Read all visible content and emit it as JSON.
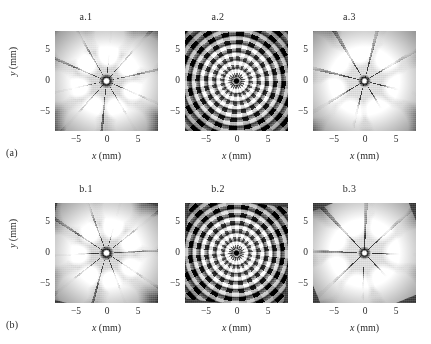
{
  "figure": {
    "rows": [
      {
        "row_label": "(a)",
        "panels": [
          {
            "title": "a.1",
            "xlabel_var": "x",
            "xlabel_unit": "(mm)",
            "ylabel_var": "y",
            "ylabel_unit": "(mm)",
            "xticks": [
              "−5",
              "0",
              "5"
            ],
            "yticks": [
              "5",
              "0",
              "−5"
            ]
          },
          {
            "title": "a.2",
            "xlabel_var": "x",
            "xlabel_unit": "(mm)",
            "ylabel_var": "y",
            "ylabel_unit": "(mm)",
            "xticks": [
              "−5",
              "0",
              "5"
            ],
            "yticks": [
              "5",
              "0",
              "−5"
            ]
          },
          {
            "title": "a.3",
            "xlabel_var": "x",
            "xlabel_unit": "(mm)",
            "ylabel_var": "y",
            "ylabel_unit": "(mm)",
            "xticks": [
              "−5",
              "0",
              "5"
            ],
            "yticks": [
              "5",
              "0",
              "−5"
            ]
          }
        ]
      },
      {
        "row_label": "(b)",
        "panels": [
          {
            "title": "b.1",
            "xlabel_var": "x",
            "xlabel_unit": "(mm)",
            "ylabel_var": "y",
            "ylabel_unit": "(mm)",
            "xticks": [
              "−5",
              "0",
              "5"
            ],
            "yticks": [
              "5",
              "0",
              "−5"
            ]
          },
          {
            "title": "b.2",
            "xlabel_var": "x",
            "xlabel_unit": "(mm)",
            "ylabel_var": "y",
            "ylabel_unit": "(mm)",
            "xticks": [
              "−5",
              "0",
              "5"
            ],
            "yticks": [
              "5",
              "0",
              "−5"
            ]
          },
          {
            "title": "b.3",
            "xlabel_var": "x",
            "xlabel_unit": "(mm)",
            "ylabel_var": "y",
            "ylabel_unit": "(mm)",
            "xticks": [
              "−5",
              "0",
              "5"
            ],
            "yticks": [
              "5",
              "0",
              "−5"
            ]
          }
        ]
      }
    ]
  },
  "chart_data": {
    "type": "heatmap",
    "title": "",
    "subtitle": "",
    "layout": {
      "rows": 2,
      "cols": 3,
      "grid_on": false,
      "legend": "none",
      "colormap": "gray",
      "background": "#ffffff"
    },
    "shared_axes": {
      "xlabel": "x (mm)",
      "ylabel": "y (mm)",
      "xlim": [
        -9,
        9
      ],
      "ylim": [
        -9,
        9
      ],
      "xticks": [
        -5,
        0,
        5
      ],
      "yticks": [
        -5,
        0,
        5
      ],
      "xticklabels": [
        "-5",
        "0",
        "5"
      ],
      "yticklabels": [
        "-5",
        "0",
        "5"
      ]
    },
    "panels": [
      {
        "id": "a.1",
        "row": "(a)",
        "col": 1,
        "description": "Grayscale transverse intensity pattern: small bright core with dark radial spokes, inner ring of bright lobes and an outer ring of large bright lobes; medium-gray background.",
        "rotational_symmetry_order": 10,
        "dark_radial_spokes": 10,
        "bright_rings": 2,
        "outer_lobes": 7,
        "inner_lobes": 8,
        "core": "bright-small",
        "background_level": "mid-gray"
      },
      {
        "id": "a.2",
        "row": "(a)",
        "col": 2,
        "description": "Dense multi-ring rosette of small bright spots concentrated near the center on a dark background; several concentric rings of lobes.",
        "rotational_symmetry_order": 20,
        "dark_radial_spokes": 20,
        "bright_rings": 3,
        "outer_lobes": 20,
        "inner_lobes": 10,
        "core": "dark-small",
        "background_level": "dark"
      },
      {
        "id": "a.3",
        "row": "(a)",
        "col": 3,
        "description": "Eight broad bright lobes separated by wide dark radial spokes meeting at a dark center; outer halo of bright blobs.",
        "rotational_symmetry_order": 8,
        "dark_radial_spokes": 8,
        "bright_rings": 2,
        "outer_lobes": 8,
        "inner_lobes": 7,
        "core": "dark",
        "background_level": "mid-gray"
      },
      {
        "id": "b.1",
        "row": "(b)",
        "col": 1,
        "description": "Similar to a.1 but the pattern is rotated; bright core surrounded by ring of lobes and large outer bright lobes with dark spokes.",
        "rotational_symmetry_order": 10,
        "dark_radial_spokes": 10,
        "bright_rings": 2,
        "outer_lobes": 7,
        "inner_lobes": 9,
        "core": "bright-small",
        "background_level": "mid-gray"
      },
      {
        "id": "b.2",
        "row": "(b)",
        "col": 2,
        "description": "Bright petal rosette core of about ten lobes on a dark background, surrounded by a fainter outer ring of lobes.",
        "rotational_symmetry_order": 10,
        "dark_radial_spokes": 10,
        "bright_rings": 3,
        "outer_lobes": 10,
        "inner_lobes": 10,
        "core": "dark-small",
        "background_level": "dark"
      },
      {
        "id": "b.3",
        "row": "(b)",
        "col": 3,
        "description": "Eight broad bright lobes with wide dark spokes converging on a dark center, rotated relative to a.3.",
        "rotational_symmetry_order": 8,
        "dark_radial_spokes": 8,
        "bright_rings": 2,
        "outer_lobes": 8,
        "inner_lobes": 7,
        "core": "dark",
        "background_level": "mid-gray"
      }
    ]
  }
}
